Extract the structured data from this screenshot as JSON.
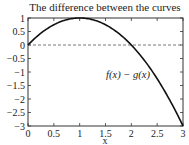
{
  "chart_data": {
    "type": "line",
    "title": "The difference between the curves",
    "xlabel": "x",
    "ylabel": "",
    "xlim": [
      0,
      3
    ],
    "ylim": [
      -3,
      1
    ],
    "xticks": [
      "0",
      "0.5",
      "1",
      "1.5",
      "2",
      "2.5",
      "3"
    ],
    "yticks": [
      "1",
      "0.5",
      "0",
      "−0.5",
      "−1",
      "−1.5",
      "−2",
      "−2.5",
      "−3"
    ],
    "grid": false,
    "series": [
      {
        "name": "f(x) − g(x)",
        "style": "solid",
        "color": "#111111",
        "x": [
          0,
          0.25,
          0.5,
          0.75,
          1,
          1.25,
          1.5,
          1.75,
          2,
          2.25,
          2.5,
          2.75,
          3
        ],
        "values": [
          0,
          0.4375,
          0.75,
          0.9375,
          1,
          0.9375,
          0.75,
          0.4375,
          0,
          -0.5625,
          -1.25,
          -2.0625,
          -3
        ]
      },
      {
        "name": "zero reference",
        "style": "dashed",
        "color": "#555555",
        "x": [
          0,
          3
        ],
        "values": [
          0,
          0
        ]
      }
    ],
    "annotations": [
      {
        "text": "f(x) − g(x)",
        "x": 1.55,
        "y": -1.1
      }
    ]
  }
}
